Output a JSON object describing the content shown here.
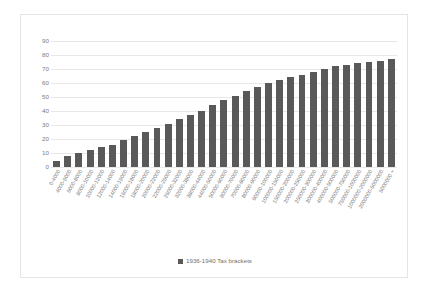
{
  "chart_data": {
    "type": "bar",
    "title": "",
    "subtitle": "",
    "xlabel": "",
    "ylabel": "",
    "ylim": [
      0,
      90
    ],
    "ytick_step": 10,
    "yticks": [
      90,
      80,
      70,
      60,
      50,
      40,
      30,
      20,
      10,
      0
    ],
    "grid": true,
    "legend_position": "bottom",
    "series_name": "1936-1940 Tax brackets",
    "bar_color": "#595959",
    "gridline_color": "#e8e8e8",
    "axis_text_color": "#7b7b7b",
    "plot_background": "#ffffff",
    "border_color": "#e4e4e4",
    "categories": [
      "0-4000",
      "4000-6000",
      "6000-8000",
      "8000-10000",
      "10000-12000",
      "12000-14000",
      "14000-16000",
      "16000-18000",
      "18000-20000",
      "20000-22000",
      "22000-26000",
      "26000-32000",
      "32000-38000",
      "38000-44000",
      "44000-50000",
      "50000-60000",
      "60000-70000",
      "70000-80000",
      "80000-90000",
      "90000-100000",
      "100000-150000",
      "150000-200000",
      "200000-250000",
      "250000-300000",
      "300000-400000",
      "400000-500000",
      "500000-750000",
      "750000-1000000",
      "1000000-2000000",
      "2000000-5000000",
      "5000000 +"
    ],
    "values": [
      4,
      8,
      10,
      12,
      14,
      16,
      19,
      22,
      25,
      28,
      31,
      34,
      37,
      40,
      44,
      48,
      51,
      54,
      57,
      60,
      62,
      64,
      66,
      68,
      70,
      72,
      73,
      74,
      75,
      76,
      77
    ],
    "series": [
      {
        "name": "1936-1940 Tax brackets",
        "values": [
          4,
          8,
          10,
          12,
          14,
          16,
          19,
          22,
          25,
          28,
          31,
          34,
          37,
          40,
          44,
          48,
          51,
          54,
          57,
          60,
          62,
          64,
          66,
          68,
          70,
          72,
          73,
          74,
          75,
          76,
          77
        ]
      }
    ]
  },
  "legend": {
    "label": "1936-1940 Tax brackets"
  }
}
